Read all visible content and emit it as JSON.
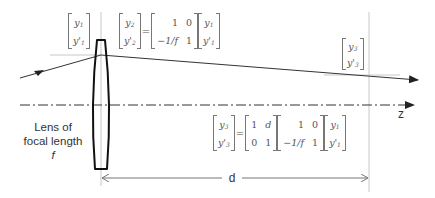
{
  "diagram": {
    "lens_label": {
      "line1": "Lens of",
      "line2": "focal length",
      "line3": "f"
    },
    "axis_label": "z",
    "distance_label": "d",
    "vectors": {
      "input": {
        "top": "y",
        "top_sub": "1",
        "bottom": "y'",
        "bottom_sub": "1"
      },
      "after_lens": {
        "top": "y",
        "top_sub": "2",
        "bottom": "y'",
        "bottom_sub": "2"
      },
      "output": {
        "top": "y",
        "top_sub": "3",
        "bottom": "y'",
        "bottom_sub": "3"
      }
    },
    "equation_lens": {
      "lhs": [
        "y2",
        "y'2"
      ],
      "equals": "=",
      "lens_matrix": [
        [
          "1",
          "0"
        ],
        [
          "−1/f",
          "1"
        ]
      ],
      "rhs": [
        "y1",
        "y'1"
      ]
    },
    "equation_total": {
      "lhs": [
        "y3",
        "y'3"
      ],
      "equals": "=",
      "propagation_matrix": [
        [
          "1",
          "d"
        ],
        [
          "0",
          "1"
        ]
      ],
      "lens_matrix": [
        [
          "1",
          "0"
        ],
        [
          "−1/f",
          "1"
        ]
      ],
      "rhs": [
        "y1",
        "y'1"
      ]
    },
    "colors": {
      "lens_outline": "#111111",
      "ray": "#333333",
      "axis": "#333333",
      "reference_lines": "#bbbbbb",
      "dimension": "#666666",
      "math_text": "#555555"
    }
  }
}
